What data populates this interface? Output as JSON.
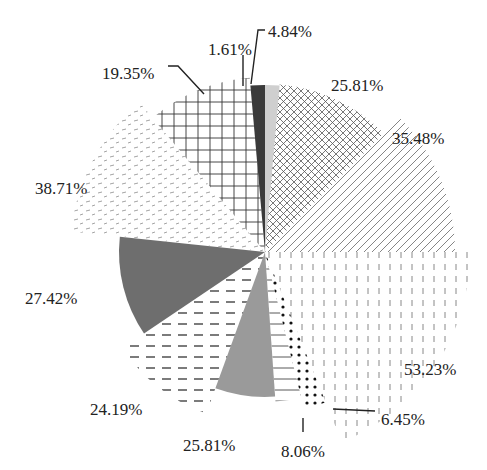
{
  "chart_data": {
    "type": "pie",
    "variant": "polar-area (variable radius sectors)",
    "title": "",
    "legend": "none",
    "center": [
      265,
      252
    ],
    "slices": [
      {
        "label": "4.84%",
        "value": 4.84,
        "start_deg": 0,
        "end_deg": 5,
        "radius": 167,
        "pattern": "light-gray-solid",
        "label_pos": [
          268,
          30
        ],
        "leader": [
          [
            265,
            30
          ],
          [
            258,
            30
          ],
          [
            251,
            84
          ]
        ]
      },
      {
        "label": "25.81%",
        "value": 25.81,
        "start_deg": 5,
        "end_deg": 45,
        "radius": 168,
        "pattern": "cross-hatch",
        "label_pos": [
          331,
          84
        ]
      },
      {
        "label": "35.48%",
        "value": 35.48,
        "start_deg": 45,
        "end_deg": 90,
        "radius": 190,
        "pattern": "diagonal-lines",
        "label_pos": [
          392,
          137
        ]
      },
      {
        "label": "53.23%",
        "value": 53.23,
        "start_deg": 90,
        "end_deg": 158,
        "radius": 205,
        "pattern": "vertical-dashes",
        "label_pos": [
          404,
          368
        ]
      },
      {
        "label": "6.45%",
        "value": 6.45,
        "start_deg": 158,
        "end_deg": 166,
        "radius": 162,
        "pattern": "dots",
        "label_pos": [
          381,
          418
        ],
        "leader": [
          [
            333,
            409
          ],
          [
            375,
            411
          ]
        ]
      },
      {
        "label": "8.06%",
        "value": 8.06,
        "start_deg": 166,
        "end_deg": 176,
        "radius": 150,
        "pattern": "horizontal-lines",
        "label_pos": [
          281,
          450
        ],
        "leader": [
          [
            303,
            418
          ],
          [
            303,
            432
          ]
        ]
      },
      {
        "label": "25.81%",
        "value": 25.81,
        "start_deg": 176,
        "end_deg": 200,
        "radius": 145,
        "pattern": "medium-gray-solid",
        "label_pos": [
          183,
          444
        ]
      },
      {
        "label": "24.19%",
        "value": 24.19,
        "start_deg": 200,
        "end_deg": 236,
        "radius": 172,
        "pattern": "dashed-horizontal",
        "label_pos": [
          90,
          408
        ]
      },
      {
        "label": "27.42%",
        "value": 27.42,
        "start_deg": 236,
        "end_deg": 276,
        "radius": 146,
        "pattern": "dark-gray-solid",
        "label_pos": [
          25,
          297
        ]
      },
      {
        "label": "38.71%",
        "value": 38.71,
        "start_deg": 276,
        "end_deg": 320,
        "radius": 195,
        "pattern": "dash-stipple",
        "label_pos": [
          35,
          187
        ]
      },
      {
        "label": "19.35%",
        "value": 19.35,
        "start_deg": 320,
        "end_deg": 355,
        "radius": 175,
        "pattern": "grid",
        "label_pos": [
          102,
          72
        ],
        "leader": [
          [
            168,
            66
          ],
          [
            178,
            66
          ],
          [
            204,
            94
          ]
        ]
      },
      {
        "label": "1.61%",
        "value": 1.61,
        "start_deg": 355,
        "end_deg": 360,
        "radius": 167,
        "pattern": "dark-solid",
        "label_pos": [
          208,
          48
        ],
        "leader": [
          [
            243,
            55
          ],
          [
            243,
            86
          ]
        ]
      }
    ]
  },
  "labels": {
    "s0": "4.84%",
    "s1": "25.81%",
    "s2": "35.48%",
    "s3": "53.23%",
    "s4": "6.45%",
    "s5": "8.06%",
    "s6": "25.81%",
    "s7": "24.19%",
    "s8": "27.42%",
    "s9": "38.71%",
    "s10": "19.35%",
    "s11": "1.61%"
  },
  "colors": {
    "text": "#222222",
    "light_gray": "#cfcfcf",
    "medium_gray": "#9a9a9a",
    "dark_gray": "#6e6e6e",
    "dark": "#3a3a3a",
    "hatch": "#555555"
  }
}
